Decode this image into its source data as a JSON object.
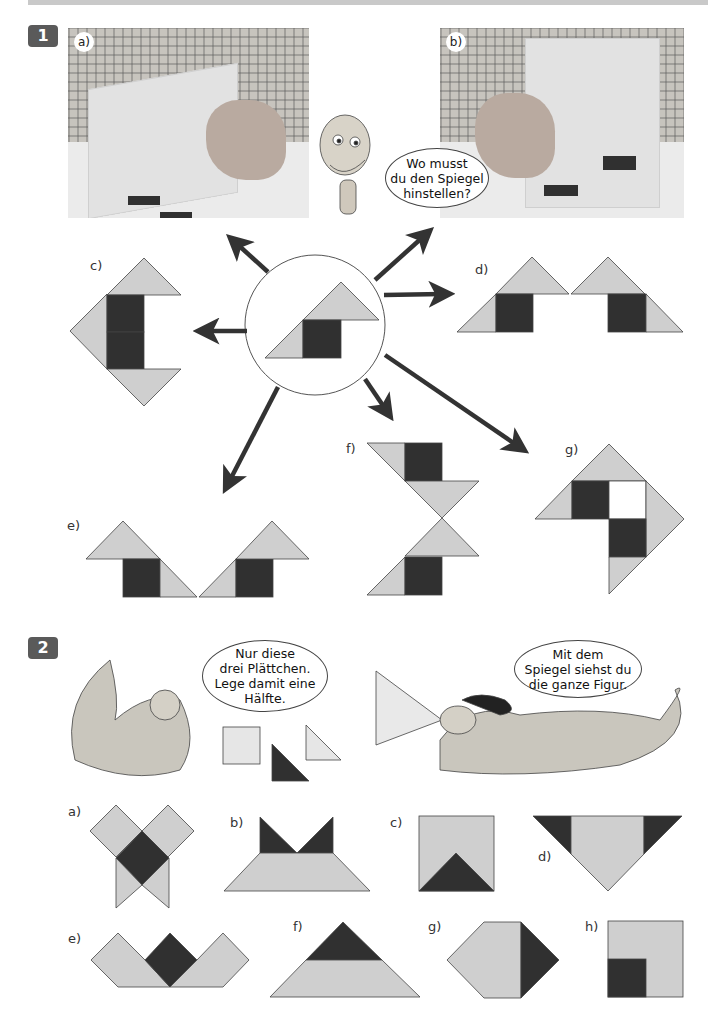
{
  "header": {
    "bar_color": "#c9c9c9"
  },
  "task1": {
    "number": "1",
    "photo_a": {
      "label": "a)"
    },
    "photo_b": {
      "label": "b)"
    },
    "speech": "Wo musst\ndu den Spiegel\nhinstellen?",
    "figure_labels": {
      "c": "c)",
      "d": "d)",
      "e": "e)",
      "f": "f)",
      "g": "g)"
    }
  },
  "task2": {
    "number": "2",
    "speech_left": "Nur diese\ndrei Plättchen.\nLege damit eine\nHälfte.",
    "speech_right": "Mit dem\nSpiegel siehst du\ndie ganze Figur.",
    "figure_labels": {
      "a": "a)",
      "b": "b)",
      "c": "c)",
      "d": "d)",
      "e": "e)",
      "f": "f)",
      "g": "g)",
      "h": "h)"
    }
  },
  "colors": {
    "light_tile": "#cfcfcf",
    "dark_tile": "#303030",
    "badge": "#5a5a5a",
    "arrow": "#333333"
  }
}
